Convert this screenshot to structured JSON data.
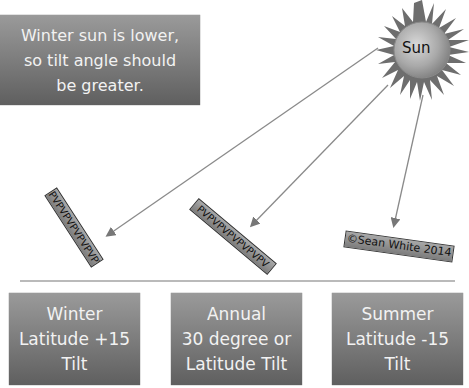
{
  "note": {
    "lines": [
      "Winter sun is lower,",
      "so tilt angle should",
      "be greater."
    ]
  },
  "sun": {
    "label": "Sun"
  },
  "panels": [
    {
      "id": "winter-panel",
      "text": "PVPVPVPVPVPVPV"
    },
    {
      "id": "annual-panel",
      "text": "PVPVPVPVPVPVPV"
    },
    {
      "id": "summer-panel",
      "text": "©Sean White 2014"
    }
  ],
  "tiles": [
    {
      "lines": [
        "Winter",
        "Latitude +15",
        "Tilt"
      ]
    },
    {
      "lines": [
        "Annual",
        "30 degree or",
        "Latitude Tilt"
      ]
    },
    {
      "lines": [
        "Summer",
        "Latitude -15",
        "Tilt"
      ]
    }
  ],
  "colors": {
    "box_top": "#9a9a9a",
    "box_bottom": "#5f5f5f",
    "box_text": "#f2f2f2",
    "arrow": "#8a8a8a",
    "ground": "#777777",
    "sun_rays": "#6e6e6e",
    "sun_core": "#b5b5b5"
  }
}
